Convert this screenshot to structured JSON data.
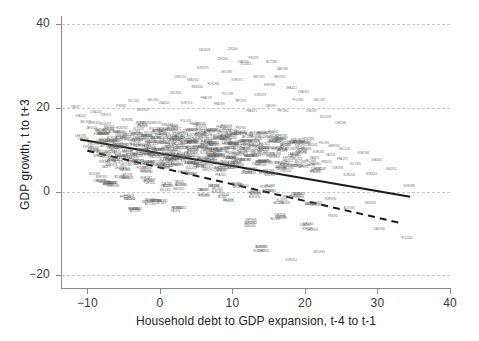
{
  "chart_data": {
    "type": "scatter",
    "title": "",
    "xlabel": "Household debt to GDP expansion, t-4 to t-1",
    "ylabel": "GDP growth, t to t+3",
    "xlim": [
      -13.5,
      40
    ],
    "ylim": [
      -23,
      42
    ],
    "xticks": [
      -10,
      0,
      10,
      20,
      30,
      40
    ],
    "xticklabels": [
      "−10",
      "0",
      "10",
      "20",
      "30",
      "40"
    ],
    "yticks": [
      -20,
      0,
      20,
      40
    ],
    "yticklabels": [
      "−20",
      "0",
      "20",
      "40"
    ],
    "grid": "horizontal-dashed",
    "legend": "none",
    "point_labels": "country-year codes",
    "series": [
      {
        "name": "observations",
        "marker": "text-label",
        "points": [
          [
            -10.9,
            13.3
          ],
          [
            -10.4,
            12.2
          ],
          [
            -10.1,
            16.6
          ],
          [
            -9.8,
            10.4
          ],
          [
            -9.5,
            14.9
          ],
          [
            -9.2,
            11.1
          ],
          [
            -8.9,
            16.2
          ],
          [
            -8.6,
            9.6
          ],
          [
            -8.3,
            12.9
          ],
          [
            -8.0,
            8.1
          ],
          [
            -7.8,
            13.8
          ],
          [
            -7.5,
            11.3
          ],
          [
            -7.2,
            6.4
          ],
          [
            -7.0,
            15.2
          ],
          [
            -6.8,
            9.9
          ],
          [
            -6.5,
            12.6
          ],
          [
            -6.3,
            7.2
          ],
          [
            -6.0,
            10.8
          ],
          [
            -5.8,
            14.4
          ],
          [
            -5.5,
            8.6
          ],
          [
            -5.3,
            11.8
          ],
          [
            -5.0,
            5.9
          ],
          [
            -4.8,
            13.1
          ],
          [
            -4.5,
            9.3
          ],
          [
            -4.3,
            16.8
          ],
          [
            -4.0,
            7.6
          ],
          [
            -3.8,
            11.4
          ],
          [
            -3.5,
            14.1
          ],
          [
            -3.3,
            6.8
          ],
          [
            -3.0,
            10.2
          ],
          [
            -2.8,
            12.7
          ],
          [
            -2.5,
            8.4
          ],
          [
            -2.3,
            15.6
          ],
          [
            -2.0,
            5.1
          ],
          [
            -1.8,
            11.0
          ],
          [
            -1.6,
            13.5
          ],
          [
            -1.4,
            9.1
          ],
          [
            -1.2,
            7.0
          ],
          [
            -1.0,
            12.2
          ],
          [
            -0.8,
            10.5
          ],
          [
            -0.6,
            16.0
          ],
          [
            -0.4,
            8.8
          ],
          [
            -0.2,
            14.2
          ],
          [
            0.0,
            6.2
          ],
          [
            0.2,
            11.6
          ],
          [
            0.4,
            9.4
          ],
          [
            0.6,
            13.0
          ],
          [
            0.8,
            7.8
          ],
          [
            1.0,
            10.9
          ],
          [
            1.2,
            15.1
          ],
          [
            1.4,
            5.6
          ],
          [
            1.6,
            12.4
          ],
          [
            1.8,
            8.2
          ],
          [
            2.0,
            14.7
          ],
          [
            2.2,
            10.1
          ],
          [
            2.4,
            6.6
          ],
          [
            2.6,
            11.9
          ],
          [
            2.8,
            9.0
          ],
          [
            3.0,
            13.4
          ],
          [
            3.2,
            7.4
          ],
          [
            3.4,
            16.3
          ],
          [
            3.6,
            10.6
          ],
          [
            3.8,
            4.9
          ],
          [
            4.0,
            12.1
          ],
          [
            4.2,
            8.7
          ],
          [
            4.4,
            14.0
          ],
          [
            4.6,
            6.1
          ],
          [
            4.8,
            11.2
          ],
          [
            5.0,
            9.7
          ],
          [
            5.2,
            15.4
          ],
          [
            5.4,
            7.1
          ],
          [
            5.6,
            12.8
          ],
          [
            5.8,
            10.0
          ],
          [
            6.0,
            5.3
          ],
          [
            6.2,
            13.6
          ],
          [
            6.4,
            8.5
          ],
          [
            6.6,
            11.5
          ],
          [
            6.8,
            6.9
          ],
          [
            7.0,
            14.5
          ],
          [
            7.2,
            9.2
          ],
          [
            7.4,
            12.0
          ],
          [
            7.6,
            7.7
          ],
          [
            7.8,
            10.3
          ],
          [
            8.0,
            4.6
          ],
          [
            8.2,
            13.2
          ],
          [
            8.4,
            8.9
          ],
          [
            8.6,
            11.7
          ],
          [
            8.8,
            6.3
          ],
          [
            9.0,
            15.0
          ],
          [
            9.2,
            9.8
          ],
          [
            9.4,
            12.5
          ],
          [
            9.6,
            7.3
          ],
          [
            9.8,
            10.7
          ],
          [
            10.0,
            5.7
          ],
          [
            10.2,
            13.9
          ],
          [
            10.4,
            8.0
          ],
          [
            10.6,
            11.1
          ],
          [
            10.8,
            6.7
          ],
          [
            11.0,
            14.3
          ],
          [
            11.2,
            9.5
          ],
          [
            11.5,
            12.3
          ],
          [
            11.8,
            7.9
          ],
          [
            12.0,
            10.4
          ],
          [
            12.3,
            5.0
          ],
          [
            12.6,
            13.7
          ],
          [
            12.9,
            8.3
          ],
          [
            13.2,
            11.3
          ],
          [
            13.5,
            6.5
          ],
          [
            13.8,
            9.9
          ],
          [
            14.1,
            12.9
          ],
          [
            14.4,
            7.5
          ],
          [
            14.7,
            10.8
          ],
          [
            15.0,
            4.2
          ],
          [
            15.3,
            13.1
          ],
          [
            15.6,
            8.8
          ],
          [
            15.9,
            11.4
          ],
          [
            16.2,
            6.0
          ],
          [
            16.5,
            9.6
          ],
          [
            16.8,
            12.6
          ],
          [
            17.1,
            7.2
          ],
          [
            17.5,
            10.2
          ],
          [
            17.9,
            5.4
          ],
          [
            18.3,
            12.0
          ],
          [
            18.7,
            8.1
          ],
          [
            19.1,
            10.9
          ],
          [
            19.5,
            6.3
          ],
          [
            20.0,
            9.3
          ],
          [
            20.5,
            11.8
          ],
          [
            21.0,
            7.0
          ],
          [
            21.5,
            4.5
          ],
          [
            22.0,
            9.0
          ],
          [
            22.5,
            11.2
          ],
          [
            23.0,
            6.6
          ],
          [
            23.5,
            8.4
          ],
          [
            24.0,
            10.5
          ],
          [
            24.5,
            5.2
          ],
          [
            25.0,
            7.8
          ],
          [
            25.5,
            9.8
          ],
          [
            26.0,
            3.8
          ],
          [
            27.0,
            6.8
          ],
          [
            28.0,
            8.6
          ],
          [
            29.0,
            4.4
          ],
          [
            30.0,
            7.0
          ],
          [
            32.0,
            5.5
          ],
          [
            34.5,
            1.5
          ],
          [
            -9.0,
            19.2
          ],
          [
            -7.6,
            18.4
          ],
          [
            -5.2,
            20.1
          ],
          [
            -3.6,
            21.5
          ],
          [
            -2.4,
            19.6
          ],
          [
            -1.0,
            22.0
          ],
          [
            0.5,
            20.8
          ],
          [
            2.0,
            23.6
          ],
          [
            3.5,
            21.2
          ],
          [
            5.0,
            24.9
          ],
          [
            6.5,
            22.4
          ],
          [
            8.0,
            20.6
          ],
          [
            9.5,
            23.1
          ],
          [
            11.0,
            21.0
          ],
          [
            12.5,
            19.4
          ],
          [
            14.0,
            22.8
          ],
          [
            15.5,
            20.2
          ],
          [
            17.0,
            18.8
          ],
          [
            19.0,
            21.6
          ],
          [
            21.0,
            19.0
          ],
          [
            23.0,
            17.6
          ],
          [
            25.0,
            16.2
          ],
          [
            3.0,
            27.4
          ],
          [
            4.5,
            26.1
          ],
          [
            6.0,
            29.3
          ],
          [
            7.5,
            25.8
          ],
          [
            9.0,
            28.2
          ],
          [
            10.5,
            26.6
          ],
          [
            12.0,
            30.0
          ],
          [
            13.5,
            27.0
          ],
          [
            15.0,
            25.4
          ],
          [
            16.5,
            26.9
          ],
          [
            18.0,
            24.6
          ],
          [
            20.0,
            23.2
          ],
          [
            22.0,
            21.8
          ],
          [
            6.0,
            33.8
          ],
          [
            8.5,
            31.4
          ],
          [
            10.0,
            34.2
          ],
          [
            11.5,
            30.6
          ],
          [
            13.0,
            32.0
          ],
          [
            15.5,
            30.9
          ],
          [
            17.0,
            29.0
          ],
          [
            -11.5,
            19.8
          ],
          [
            -10.8,
            18.0
          ],
          [
            1.0,
            0.8
          ],
          [
            3.0,
            1.2
          ],
          [
            5.5,
            -0.4
          ],
          [
            7.5,
            0.5
          ],
          [
            9.0,
            -1.8
          ],
          [
            11.0,
            1.0
          ],
          [
            13.0,
            -0.9
          ],
          [
            15.0,
            0.2
          ],
          [
            17.0,
            -2.4
          ],
          [
            19.0,
            -1.2
          ],
          [
            21.0,
            -3.6
          ],
          [
            23.5,
            -2.0
          ],
          [
            26.0,
            -4.2
          ],
          [
            29.0,
            -3.0
          ],
          [
            12.0,
            -7.8
          ],
          [
            16.5,
            -6.4
          ],
          [
            20.5,
            -8.6
          ],
          [
            24.0,
            -5.8
          ],
          [
            30.0,
            -9.4
          ],
          [
            34.0,
            -11.0
          ],
          [
            14.0,
            -13.6
          ],
          [
            18.0,
            -16.4
          ],
          [
            22.0,
            -14.2
          ],
          [
            2.5,
            -4.6
          ],
          [
            -1.5,
            -2.8
          ],
          [
            -4.5,
            -1.4
          ],
          [
            -6.5,
            1.6
          ],
          [
            -8.5,
            3.2
          ],
          [
            -2.0,
            2.4
          ],
          [
            0.0,
            -3.2
          ],
          [
            -3.5,
            -5.0
          ],
          [
            -5.0,
            3.8
          ],
          [
            -7.0,
            2.0
          ]
        ]
      }
    ],
    "fit_lines": [
      {
        "name": "solid-fit",
        "style": "solid",
        "color": "#1a1a1a",
        "x0": -11.0,
        "y0": 12.5,
        "x1": 34.5,
        "y1": -1.2
      },
      {
        "name": "dashed-fit",
        "style": "dashed",
        "color": "#1a1a1a",
        "x0": -10.0,
        "y0": 9.8,
        "x1": 33.5,
        "y1": -7.6
      }
    ]
  },
  "figure": {
    "background": "#ffffff",
    "grid_color": "#c8c8c8",
    "axis_color": "#8a8a8a",
    "tick_text_color": "#3a3a3a",
    "label_text_color": "#1d1d1d",
    "point_text_color": "#6e6e6e"
  }
}
